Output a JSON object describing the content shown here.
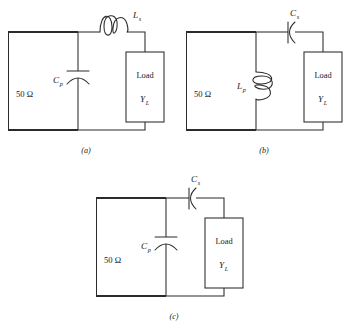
{
  "figure": {
    "background_color": "#ffffff",
    "line_color": "#2b2b2b",
    "source_label": "50 Ω",
    "load_label": "Load",
    "load_admittance_symbol": "Y",
    "load_admittance_subscript": "L"
  },
  "circuits": [
    {
      "id": "a",
      "caption": "(a)",
      "source_label": "50 Ω",
      "load_label": "Load",
      "load_admittance_symbol": "Y",
      "load_admittance_subscript": "L",
      "series_element": {
        "kind": "inductor",
        "symbol": "L",
        "subscript": "s",
        "orientation": "horizontal",
        "position": "series-top"
      },
      "shunt_element": {
        "kind": "capacitor",
        "symbol": "C",
        "subscript": "p",
        "orientation": "vertical",
        "position": "shunt-left"
      }
    },
    {
      "id": "b",
      "caption": "(b)",
      "source_label": "50 Ω",
      "load_label": "Load",
      "load_admittance_symbol": "Y",
      "load_admittance_subscript": "L",
      "series_element": {
        "kind": "capacitor",
        "symbol": "C",
        "subscript": "s",
        "orientation": "horizontal",
        "position": "series-top"
      },
      "shunt_element": {
        "kind": "inductor",
        "symbol": "L",
        "subscript": "p",
        "orientation": "vertical",
        "position": "shunt-left"
      }
    },
    {
      "id": "c",
      "caption": "(c)",
      "source_label": "50 Ω",
      "load_label": "Load",
      "load_admittance_symbol": "Y",
      "load_admittance_subscript": "L",
      "series_element": {
        "kind": "capacitor",
        "symbol": "C",
        "subscript": "s",
        "orientation": "horizontal",
        "position": "series-top"
      },
      "shunt_element": {
        "kind": "capacitor",
        "symbol": "C",
        "subscript": "p",
        "orientation": "vertical",
        "position": "shunt-left"
      }
    }
  ]
}
